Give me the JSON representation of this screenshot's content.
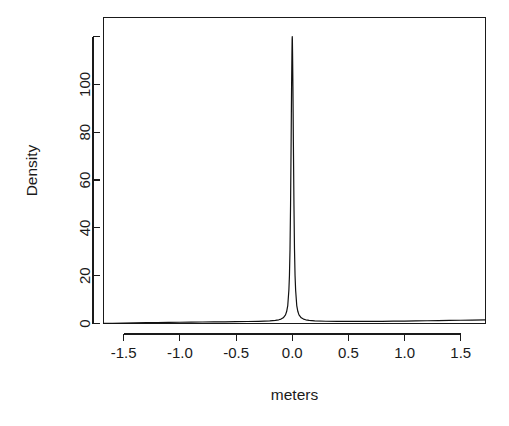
{
  "figure": {
    "width": 509,
    "height": 426,
    "background_color": "#ffffff",
    "foreground_color": "#1a1a1a",
    "curve_color": "#111111"
  },
  "chart_data": {
    "type": "line",
    "title": "",
    "subtitle": "",
    "xlabel": "meters",
    "ylabel": "Density",
    "xlim": [
      -1.68,
      1.72
    ],
    "ylim": [
      0,
      128
    ],
    "grid": false,
    "legend": null,
    "annotations": [],
    "xticks": [
      -1.5,
      -1.0,
      -0.5,
      0.0,
      0.5,
      1.0,
      1.5
    ],
    "xticklabels": [
      "-1.5",
      "-1.0",
      "-0.5",
      "0.0",
      "0.5",
      "1.0",
      "1.5"
    ],
    "yticks": [
      0,
      20,
      40,
      60,
      80,
      100,
      120
    ],
    "yticklabels": [
      "0",
      "20",
      "40",
      "60",
      "80",
      "100",
      ""
    ],
    "series": [
      {
        "name": "density",
        "x": [
          -1.68,
          -1.6,
          -1.5,
          -1.4,
          -1.3,
          -1.2,
          -1.1,
          -1.0,
          -0.9,
          -0.8,
          -0.7,
          -0.6,
          -0.5,
          -0.4,
          -0.3,
          -0.2,
          -0.15,
          -0.12,
          -0.1,
          -0.08,
          -0.06,
          -0.05,
          -0.04,
          -0.03,
          -0.025,
          -0.02,
          -0.015,
          -0.01,
          -0.006,
          -0.003,
          -0.001,
          0.0,
          0.001,
          0.003,
          0.006,
          0.01,
          0.015,
          0.02,
          0.025,
          0.03,
          0.04,
          0.05,
          0.06,
          0.08,
          0.1,
          0.12,
          0.15,
          0.2,
          0.3,
          0.4,
          0.5,
          0.6,
          0.7,
          0.8,
          0.9,
          1.0,
          1.1,
          1.2,
          1.3,
          1.4,
          1.5,
          1.6,
          1.72
        ],
        "y": [
          0.05,
          0.1,
          0.18,
          0.26,
          0.33,
          0.4,
          0.46,
          0.52,
          0.57,
          0.62,
          0.67,
          0.72,
          0.77,
          0.83,
          0.92,
          1.1,
          1.3,
          1.55,
          1.85,
          2.4,
          3.6,
          5.0,
          7.5,
          14.0,
          20.0,
          31.0,
          50.0,
          76.0,
          99.0,
          112.0,
          119.0,
          120.0,
          119.0,
          112.0,
          99.0,
          76.0,
          50.0,
          31.0,
          20.0,
          14.0,
          7.5,
          5.0,
          3.6,
          2.4,
          1.85,
          1.55,
          1.3,
          1.1,
          0.95,
          0.9,
          0.88,
          0.88,
          0.9,
          0.93,
          0.97,
          1.02,
          1.08,
          1.14,
          1.21,
          1.28,
          1.36,
          1.43,
          1.52
        ]
      }
    ]
  }
}
